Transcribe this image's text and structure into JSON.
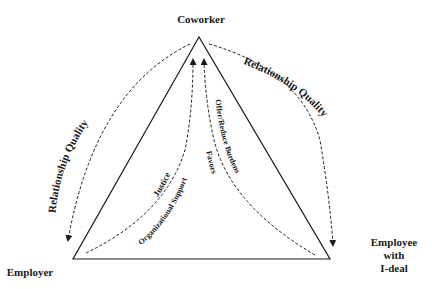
{
  "nodes": {
    "top": {
      "label": "Coworker"
    },
    "left": {
      "label": "Employer"
    },
    "right": {
      "label_lines": [
        "Employee",
        "with",
        "I-deal"
      ]
    }
  },
  "edges": {
    "outer_left": {
      "label": "Relationship Quality",
      "from": "Coworker",
      "to": "Employer"
    },
    "outer_right": {
      "label": "Relationship Quality",
      "from": "Coworker",
      "to": "Employee with I-deal"
    },
    "inner_left": {
      "labels": [
        "Justice",
        "Organizational Support"
      ],
      "from": "Employer",
      "to": "Coworker"
    },
    "inner_right": {
      "labels": [
        "Offer/Reduce Burdens",
        "Favors"
      ],
      "from": "Employee with I-deal",
      "to": "Coworker"
    }
  },
  "colors": {
    "line": "#1a1a1a",
    "background": "#ffffff"
  }
}
